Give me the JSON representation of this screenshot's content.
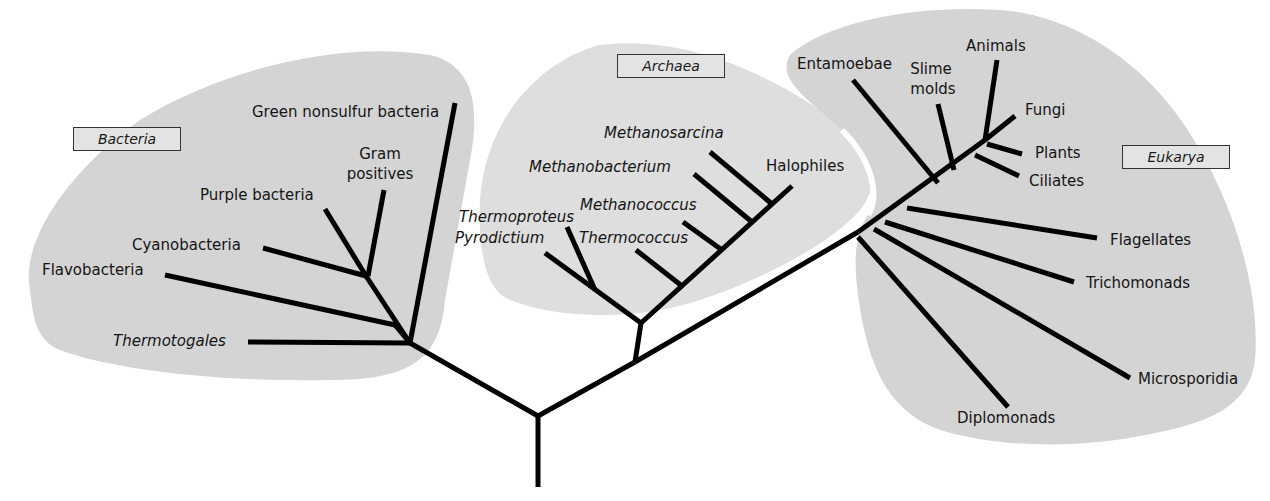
{
  "diagram": {
    "colors": {
      "region_fill": "#d4d4d4",
      "archaea_fill": "#dddddd",
      "branch": "#000000",
      "label_box": "#e3e3e3"
    },
    "domains": [
      {
        "id": "bacteria",
        "label": "Bacteria"
      },
      {
        "id": "archaea",
        "label": "Archaea"
      },
      {
        "id": "eukarya",
        "label": "Eukarya"
      }
    ],
    "bacteria": {
      "taxa": [
        "Green nonsulfur bacteria",
        "Gram",
        "positives",
        "Purple bacteria",
        "Cyanobacteria",
        "Flavobacteria",
        "Thermotogales"
      ]
    },
    "archaea": {
      "taxa": [
        "Methanosarcina",
        "Methanobacterium",
        "Halophiles",
        "Methanococcus",
        "Thermoproteus",
        "Pyrodictium",
        "Thermococcus"
      ]
    },
    "eukarya": {
      "taxa": [
        "Entamoebae",
        "Slime",
        "molds",
        "Animals",
        "Fungi",
        "Plants",
        "Ciliates",
        "Flagellates",
        "Trichomonads",
        "Microsporidia",
        "Diplomonads"
      ]
    }
  }
}
